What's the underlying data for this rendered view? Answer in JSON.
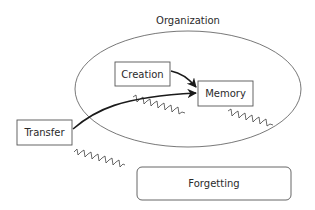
{
  "diagram": {
    "container": {
      "label": "Organization"
    },
    "nodes": {
      "creation": {
        "label": "Creation"
      },
      "memory": {
        "label": "Memory"
      },
      "transfer": {
        "label": "Transfer"
      },
      "forgetting": {
        "label": "Forgetting"
      }
    },
    "edges": [
      {
        "from": "Creation",
        "to": "Memory",
        "style": "solid-arrow"
      },
      {
        "from": "Transfer",
        "to": "Memory",
        "style": "solid-arrow"
      },
      {
        "from": "Transfer",
        "to": "Forgetting",
        "style": "wavy"
      },
      {
        "from": "Organization",
        "to": "Forgetting",
        "style": "wavy"
      },
      {
        "from": "Memory",
        "to": "Forgetting",
        "style": "wavy"
      }
    ],
    "colors": {
      "stroke": "#555555",
      "text": "#2a2a2a",
      "arrow": "#1a1a1a"
    }
  }
}
